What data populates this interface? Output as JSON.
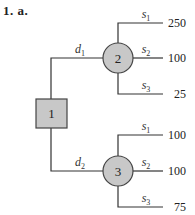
{
  "title": "1. a.",
  "decision_node": {
    "id": "1",
    "shape": "square",
    "color": "#c8c8c8"
  },
  "chance_nodes": [
    {
      "id": "2",
      "shape": "circle",
      "color": "#c8c8c8",
      "incoming_decision": {
        "var": "d",
        "sub": "1"
      },
      "branches": [
        {
          "var": "s",
          "sub": "1",
          "payoff": "250"
        },
        {
          "var": "s",
          "sub": "2",
          "payoff": "100"
        },
        {
          "var": "s",
          "sub": "3",
          "payoff": "25"
        }
      ]
    },
    {
      "id": "3",
      "shape": "circle",
      "color": "#c8c8c8",
      "incoming_decision": {
        "var": "d",
        "sub": "2"
      },
      "branches": [
        {
          "var": "s",
          "sub": "1",
          "payoff": "100"
        },
        {
          "var": "s",
          "sub": "2",
          "payoff": "100"
        },
        {
          "var": "s",
          "sub": "3",
          "payoff": "75"
        }
      ]
    }
  ]
}
